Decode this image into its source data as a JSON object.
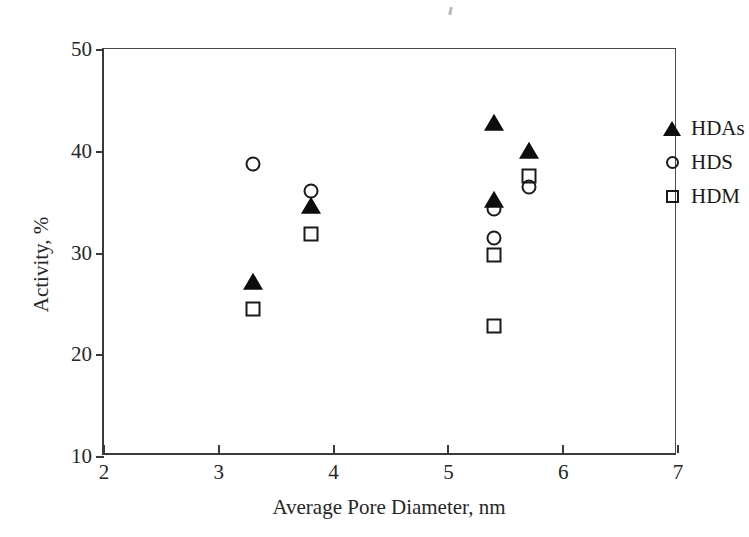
{
  "chart_data": {
    "type": "scatter",
    "title": "",
    "xlabel": "Average Pore Diameter, nm",
    "ylabel": "Activity, %",
    "xlim": [
      2,
      7
    ],
    "ylim": [
      10,
      50
    ],
    "xticks": [
      2,
      3,
      4,
      5,
      6,
      7
    ],
    "yticks": [
      10,
      20,
      30,
      40,
      50
    ],
    "grid": false,
    "legend_position": "top-right",
    "series": [
      {
        "name": "HDAs",
        "marker": "filled-triangle",
        "color": "#0d0d0d",
        "points": [
          {
            "x": 3.3,
            "y": 27.1
          },
          {
            "x": 3.8,
            "y": 34.6
          },
          {
            "x": 5.4,
            "y": 42.7
          },
          {
            "x": 5.4,
            "y": 35.2
          },
          {
            "x": 5.7,
            "y": 40.0
          }
        ]
      },
      {
        "name": "HDS",
        "marker": "open-circle",
        "color": "#1a1a1a",
        "points": [
          {
            "x": 3.3,
            "y": 38.7
          },
          {
            "x": 3.8,
            "y": 36.0
          },
          {
            "x": 5.4,
            "y": 34.3
          },
          {
            "x": 5.4,
            "y": 31.4
          },
          {
            "x": 5.7,
            "y": 36.4
          }
        ]
      },
      {
        "name": "HDM",
        "marker": "open-square",
        "color": "#1a1a1a",
        "points": [
          {
            "x": 3.3,
            "y": 24.4
          },
          {
            "x": 3.8,
            "y": 31.8
          },
          {
            "x": 5.4,
            "y": 29.8
          },
          {
            "x": 5.4,
            "y": 22.8
          },
          {
            "x": 5.7,
            "y": 37.5
          }
        ]
      }
    ]
  }
}
